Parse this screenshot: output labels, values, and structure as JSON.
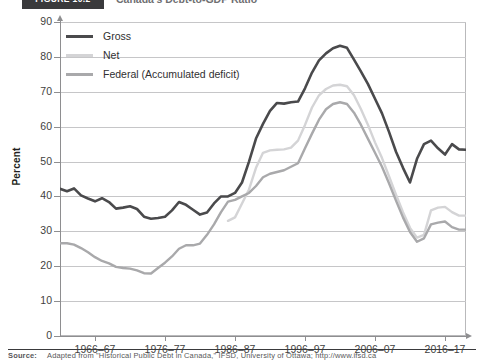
{
  "figure": {
    "tag": "FIGURE 10.2",
    "title": "Canada's Debt-to-GDP Ratio"
  },
  "legend": {
    "position": "top-left",
    "items": [
      {
        "label": "Gross",
        "color": "#4a4a4c"
      },
      {
        "label": "Net",
        "color": "#d4d4d6"
      },
      {
        "label": "Federal (Accumulated deficit)",
        "color": "#a9a9ab"
      }
    ]
  },
  "axes": {
    "y_title": "Percent",
    "y_ticks": [
      "90",
      "80",
      "70",
      "60",
      "50",
      "40",
      "30",
      "20",
      "10",
      "0"
    ],
    "x_ticks": [
      "1966–67",
      "1976–77",
      "1986–87",
      "1996–97",
      "2006–07",
      "2016–17"
    ]
  },
  "footer": {
    "source_label": "Source:",
    "source_text": "Adapted from \"Historical Public Debt in Canada,\" IFSD, University of Ottawa; http://www.ifsd.ca"
  },
  "chart_data": {
    "type": "line",
    "title": "Canada's Debt-to-GDP Ratio",
    "xlabel": "",
    "ylabel": "Percent",
    "ylim": [
      0,
      90
    ],
    "grid": true,
    "legend_position": "top-left",
    "x_tick_labels": [
      "1966–67",
      "1976–77",
      "1986–87",
      "1996–97",
      "2006–07",
      "2016–17"
    ],
    "x": [
      "1961–62",
      "1962–63",
      "1963–64",
      "1964–65",
      "1965–66",
      "1966–67",
      "1967–68",
      "1968–69",
      "1969–70",
      "1970–71",
      "1971–72",
      "1972–73",
      "1973–74",
      "1974–75",
      "1975–76",
      "1976–77",
      "1977–78",
      "1978–79",
      "1979–80",
      "1980–81",
      "1981–82",
      "1982–83",
      "1983–84",
      "1984–85",
      "1985–86",
      "1986–87",
      "1987–88",
      "1988–89",
      "1989–90",
      "1990–91",
      "1991–92",
      "1992–93",
      "1993–94",
      "1994–95",
      "1995–96",
      "1996–97",
      "1997–98",
      "1998–99",
      "1999–00",
      "2000–01",
      "2001–02",
      "2002–03",
      "2003–04",
      "2004–05",
      "2005–06",
      "2006–07",
      "2007–08",
      "2008–09",
      "2009–10",
      "2010–11",
      "2011–12",
      "2012–13",
      "2013–14",
      "2014–15",
      "2015–16",
      "2016–17",
      "2017–18",
      "2018–19",
      "2019–20"
    ],
    "series": [
      {
        "name": "Gross",
        "color": "#4a4a4c",
        "values": [
          42.2,
          41.5,
          42.3,
          40.3,
          39.4,
          38.6,
          39.5,
          38.4,
          36.5,
          36.8,
          37.2,
          36.4,
          34.2,
          33.6,
          33.8,
          34.2,
          36.0,
          38.4,
          37.6,
          36.2,
          34.8,
          35.4,
          38.0,
          40.0,
          40.0,
          41.0,
          44.0,
          50.0,
          56.6,
          60.8,
          64.5,
          66.8,
          66.6,
          67.0,
          67.2,
          71.0,
          75.5,
          79.0,
          81.0,
          82.5,
          83.2,
          82.6,
          79.2,
          75.8,
          72.2,
          68.0,
          63.8,
          58.5,
          52.8,
          48.2,
          44.0,
          50.8,
          55.0,
          56.0,
          53.8,
          52.0,
          55.0,
          53.5,
          53.4
        ]
      },
      {
        "name": "Net",
        "color": "#d4d4d6",
        "values": [
          null,
          null,
          null,
          null,
          null,
          null,
          null,
          null,
          null,
          null,
          null,
          null,
          null,
          null,
          null,
          null,
          null,
          null,
          null,
          null,
          null,
          null,
          null,
          null,
          33.0,
          34.0,
          38.0,
          42.0,
          48.2,
          52.5,
          53.2,
          53.4,
          53.5,
          54.0,
          56.0,
          60.5,
          65.5,
          69.0,
          70.8,
          71.8,
          72.0,
          71.6,
          69.0,
          65.0,
          60.5,
          55.5,
          51.0,
          45.8,
          40.5,
          35.5,
          31.0,
          28.2,
          29.0,
          36.0,
          36.8,
          37.0,
          35.5,
          34.5,
          34.5
        ]
      },
      {
        "name": "Federal (Accumulated deficit)",
        "color": "#a9a9ab",
        "values": [
          26.6,
          26.6,
          26.2,
          25.2,
          24.0,
          22.6,
          21.5,
          20.8,
          19.8,
          19.5,
          19.3,
          18.8,
          18.0,
          17.9,
          19.5,
          21.0,
          22.8,
          25.0,
          26.0,
          26.0,
          26.5,
          29.0,
          32.0,
          35.5,
          38.5,
          39.0,
          40.0,
          41.0,
          43.0,
          45.5,
          46.5,
          47.0,
          47.5,
          48.5,
          49.5,
          53.8,
          58.0,
          62.0,
          65.0,
          66.5,
          67.0,
          66.5,
          64.0,
          60.5,
          56.5,
          52.5,
          48.5,
          43.8,
          38.8,
          34.0,
          29.8,
          27.0,
          28.0,
          32.0,
          32.5,
          32.8,
          31.2,
          30.5,
          30.5
        ]
      }
    ]
  }
}
